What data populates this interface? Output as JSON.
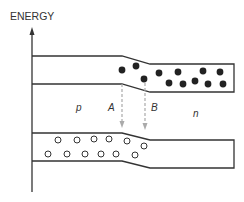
{
  "diagram": {
    "axis_label": "ENERGY",
    "region_labels": {
      "p": "p",
      "n": "n"
    },
    "transition_labels": {
      "A": "A",
      "B": "B"
    },
    "bands": {
      "conduction": {
        "carriers": "electrons (filled dots)",
        "location": "n-side"
      },
      "valence": {
        "carriers": "holes (open circles)",
        "location": "p-side"
      }
    },
    "colors": {
      "line": "#333333",
      "electron": "#222222",
      "hole_stroke": "#333333",
      "arrow": "#aaaaaa"
    }
  }
}
